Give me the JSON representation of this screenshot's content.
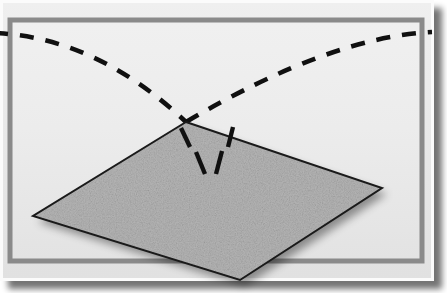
{
  "figure": {
    "title": "Particle trajectory reflecting off a textured surface plane",
    "domain": "diagram",
    "width": 447,
    "height": 293,
    "background_color": "#ffffff"
  },
  "colors": {
    "page_background": "#ffffff",
    "frame_outer_white": "#fbfbfb",
    "frame_mat": "#e6e6e6",
    "frame_border_line": "#8a8a8a",
    "panel_interior": "#ededed",
    "panel_interior_shade": "#e4e4e4",
    "plane_fill": "#b4b4b4",
    "plane_fill_light": "#bdbdbd",
    "plane_outline": "#1a1a1a",
    "plane_speckle_dark": "#8e8e8e",
    "plane_speckle_light": "#cfcfcf",
    "trajectory_dash": "#101010",
    "drop_shadow": "#b0b0b0",
    "plane_shadow": "#c9c9c9"
  },
  "frame": {
    "name": "picture-frame",
    "outer_rect": {
      "x": 0,
      "y": 0,
      "width": 434,
      "height": 281
    },
    "mat_rect": {
      "x": 2,
      "y": 2,
      "width": 428,
      "height": 275
    },
    "border_line_rect": {
      "x": 8,
      "y": 18,
      "width": 414,
      "height": 244
    },
    "border_line_width": 4,
    "interior_rect": {
      "x": 11,
      "y": 21,
      "width": 408,
      "height": 238
    },
    "drop_shadow_offset": {
      "x": 8,
      "y": 8
    }
  },
  "plane": {
    "name": "scattering-surface-plane",
    "label": "textured surface plane",
    "shape": "rhombus",
    "vertices": {
      "top": {
        "x": 186,
        "y": 122
      },
      "right": {
        "x": 382,
        "y": 188
      },
      "bottom": {
        "x": 240,
        "y": 280
      },
      "left": {
        "x": 33,
        "y": 216
      }
    },
    "outline_width": 2,
    "texture": "speckled-noise",
    "speckle_count": 1400
  },
  "trajectories": {
    "name": "dashed-trajectory-curves",
    "dash_pattern": "14 12",
    "stroke_width": 4.6,
    "incoming": {
      "name": "incoming-trajectory",
      "label": "incoming path",
      "start": {
        "x": -6,
        "y": 33
      },
      "control": {
        "x": 96,
        "y": 37
      },
      "end": {
        "x": 186,
        "y": 122
      }
    },
    "outgoing": {
      "name": "outgoing-trajectory",
      "label": "outgoing path",
      "start": {
        "x": 186,
        "y": 122
      },
      "control": {
        "x": 330,
        "y": 37
      },
      "end": {
        "x": 432,
        "y": 32
      }
    },
    "subsurface_segments": [
      {
        "name": "subsurface-dash-upper-left",
        "x1": 181,
        "y1": 128,
        "x2": 190,
        "y2": 147
      },
      {
        "name": "subsurface-dash-upper-right",
        "x1": 233,
        "y1": 127,
        "x2": 228,
        "y2": 147
      },
      {
        "name": "subsurface-dash-lower-left",
        "x1": 196,
        "y1": 152,
        "x2": 205,
        "y2": 174
      },
      {
        "name": "subsurface-dash-lower-right",
        "x1": 222,
        "y1": 151,
        "x2": 216,
        "y2": 174
      }
    ]
  }
}
